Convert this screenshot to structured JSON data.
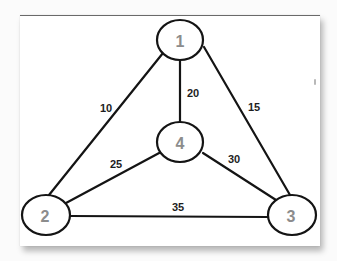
{
  "diagram": {
    "type": "weighted-undirected-graph",
    "nodes": [
      {
        "id": "1",
        "label": "1",
        "cx": 180,
        "cy": 40,
        "rx": 23,
        "ry": 20
      },
      {
        "id": "2",
        "label": "2",
        "cx": 46,
        "cy": 215,
        "rx": 24,
        "ry": 20
      },
      {
        "id": "3",
        "label": "3",
        "cx": 292,
        "cy": 215,
        "rx": 24,
        "ry": 20
      },
      {
        "id": "4",
        "label": "4",
        "cx": 180,
        "cy": 142,
        "rx": 23,
        "ry": 20
      }
    ],
    "edges": [
      {
        "from": "1",
        "to": "2",
        "weight": "10",
        "label_x": 106,
        "label_y": 108
      },
      {
        "from": "1",
        "to": "4",
        "weight": "20",
        "label_x": 193,
        "label_y": 93
      },
      {
        "from": "1",
        "to": "3",
        "weight": "15",
        "label_x": 254,
        "label_y": 107
      },
      {
        "from": "2",
        "to": "4",
        "weight": "25",
        "label_x": 116,
        "label_y": 164
      },
      {
        "from": "4",
        "to": "3",
        "weight": "30",
        "label_x": 234,
        "label_y": 159
      },
      {
        "from": "2",
        "to": "3",
        "weight": "35",
        "label_x": 178,
        "label_y": 208
      }
    ]
  },
  "colors": {
    "edge": "#141414",
    "node_label": "#8c8c8c",
    "edge_label": "#1e1e1e",
    "panel": "#ffffff"
  }
}
